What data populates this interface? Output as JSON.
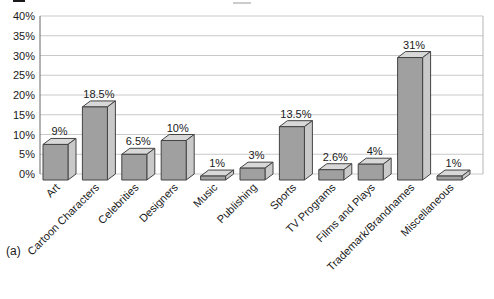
{
  "panel_label": "(a)",
  "chart_data": {
    "type": "bar",
    "style": "3d-bar",
    "title": "",
    "xlabel": "",
    "ylabel": "",
    "categories": [
      "Art",
      "Cartoon Characters",
      "Celebrities",
      "Designers",
      "Music",
      "Publishing",
      "Sports",
      "TV Programs",
      "Films and Plays",
      "Trademark/Brandnames",
      "Miscellaneous"
    ],
    "values": [
      9,
      18.5,
      6.5,
      10,
      1,
      3,
      13.5,
      2.6,
      4,
      31,
      1
    ],
    "value_labels": [
      "9%",
      "18.5%",
      "6.5%",
      "10%",
      "1%",
      "3%",
      "13.5%",
      "2.6%",
      "4%",
      "31%",
      "1%"
    ],
    "y_ticks": [
      "0%",
      "5%",
      "10%",
      "15%",
      "20%",
      "25%",
      "30%",
      "35%",
      "40%"
    ],
    "ylim": [
      0,
      40
    ],
    "y_step": 5,
    "grid": true,
    "legend": "none",
    "colors": {
      "bar_front": "#a0a0a0",
      "bar_top": "#d8d8d8",
      "bar_side": "#c9c9c9",
      "bar_stroke": "#444444",
      "gridline": "#c9c9c9",
      "plot_border": "#b5b5b5",
      "axis": "#666666",
      "text": "#1a1a1a",
      "background": "#ffffff"
    }
  }
}
